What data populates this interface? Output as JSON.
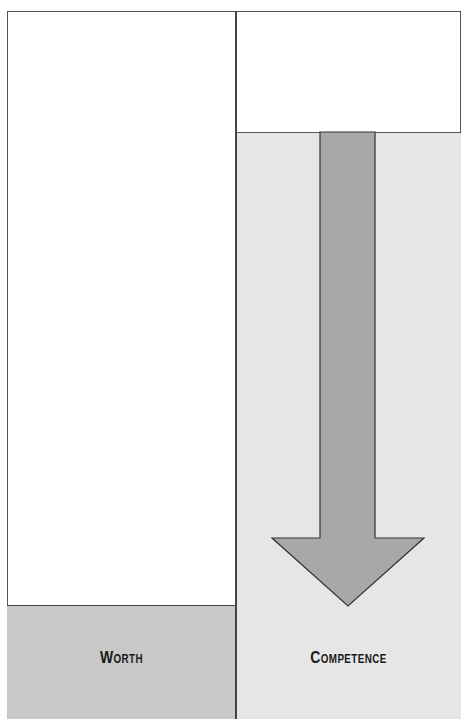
{
  "diagram": {
    "columns": [
      {
        "id": "worth",
        "label": "Worth",
        "fill_color": "#c8c8c8",
        "level_top_px": 605
      },
      {
        "id": "competence",
        "label": "Competence",
        "fill_color": "#e6e6e6",
        "level_top_px": 132
      }
    ],
    "arrow": {
      "direction": "down",
      "column": "competence",
      "color": "#a8a8a8"
    }
  }
}
